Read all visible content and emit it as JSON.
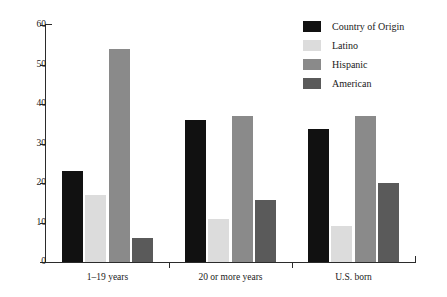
{
  "chart_data": {
    "type": "bar",
    "title": "",
    "subtitle": "",
    "xlabel": "",
    "ylabel": "",
    "categories": [
      "1–19 years",
      "20 or more years",
      "U.S. born"
    ],
    "series": [
      {
        "name": "Country of Origin",
        "color": "#111111",
        "values": [
          23,
          35.9,
          33.8
        ]
      },
      {
        "name": "Latino",
        "color": "#dcdcdc",
        "values": [
          17,
          11,
          9
        ]
      },
      {
        "name": "Hispanic",
        "color": "#8a8a8a",
        "values": [
          54,
          37,
          37
        ]
      },
      {
        "name": "American",
        "color": "#5a5a5a",
        "values": [
          6,
          15.7,
          20
        ]
      }
    ],
    "ylim": [
      0,
      60
    ],
    "yticks": [
      0,
      10,
      20,
      30,
      40,
      50,
      60
    ],
    "ytick_labels": [
      "0",
      "10",
      "20",
      "30",
      "40",
      "50",
      "60"
    ],
    "grid": false,
    "legend_position": "top-right",
    "legend_entries": [
      "Country of Origin",
      "Latino",
      "Hispanic",
      "American"
    ]
  },
  "axes": {
    "y_tick_labels": [
      "60",
      "50",
      "40",
      "30",
      "20",
      "10",
      "0"
    ],
    "x_tick_labels": [
      "1–19 years",
      "20 or more years",
      "U.S. born"
    ]
  },
  "colors": {
    "axis": "#2b2b2b",
    "text": "#1a1a1a",
    "background": "#ffffff",
    "series_country_of_origin": "#111111",
    "series_latino": "#dcdcdc",
    "series_hispanic": "#8a8a8a",
    "series_american": "#5a5a5a"
  }
}
